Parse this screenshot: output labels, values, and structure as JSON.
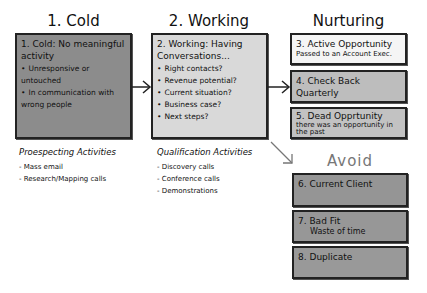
{
  "columns": {
    "cold": {
      "title": "1. Cold",
      "box": {
        "heading": "1. Cold: No meaningful activity",
        "bullets": [
          "Unresponsive or untouched",
          "In communication with wrong people"
        ],
        "color": "#8c8c8c"
      },
      "activities": {
        "title": "Proespecting Activities",
        "items": [
          "Mass email",
          "Research/Mapping calls"
        ]
      }
    },
    "working": {
      "title": "2. Working",
      "box": {
        "heading": "2. Working: Having Conversations...",
        "bullets": [
          "Right contacts?",
          "Revenue potential?",
          "Current situation?",
          "Business case?",
          "Next steps?"
        ],
        "color": "#d9d9d9"
      },
      "activities": {
        "title": "Qualification Activities",
        "items": [
          "Discovery calls",
          "Conference calls",
          "Demonstrations"
        ]
      }
    },
    "nurturing": {
      "title": "Nurturing",
      "boxes": [
        {
          "heading": "3. Active Opportunity",
          "sub": "Passed to an Account Exec.",
          "color": "#f5f5f5"
        },
        {
          "heading": "4. Check Back Quarterly",
          "sub": "",
          "color": "#bdbdbd"
        },
        {
          "heading": "5. Dead Opprtunity",
          "sub": "there was an opportunity in the past",
          "color": "#c2c2c2"
        }
      ]
    },
    "avoid": {
      "title": "Avoid",
      "boxes": [
        {
          "heading": "6. Current Client",
          "sub": "",
          "color": "#959595"
        },
        {
          "heading": "7. Bad Fit",
          "sub": "Waste of time",
          "color": "#979797"
        },
        {
          "heading": "8. Duplicate",
          "sub": "",
          "color": "#999999"
        }
      ]
    }
  }
}
